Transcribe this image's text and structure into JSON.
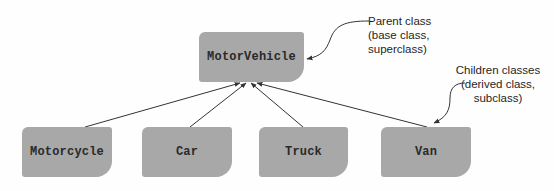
{
  "diagram": {
    "type": "class-inheritance",
    "parent": {
      "label": "MotorVehicle",
      "annotation": [
        "Parent class",
        "(base class,",
        "superclass)"
      ]
    },
    "children": [
      {
        "label": "Motorcycle"
      },
      {
        "label": "Car"
      },
      {
        "label": "Truck"
      },
      {
        "label": "Van"
      }
    ],
    "children_annotation": [
      "Children classes",
      "(derived class,",
      "subclass)"
    ],
    "colors": {
      "box_fill": "#a8a8a8",
      "text": "#2a2a2a",
      "line": "#333333"
    }
  }
}
